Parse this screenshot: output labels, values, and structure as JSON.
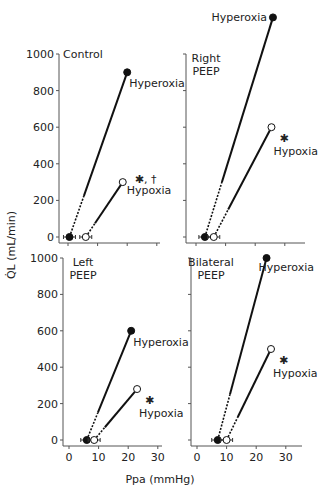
{
  "chart_data": {
    "type": "line",
    "ylabel": "Q̇L (mL/min)",
    "xlabel": "Ppa (mmHg)",
    "xlim": [
      0,
      35
    ],
    "ylim": [
      0,
      1000
    ],
    "xticks": [
      0,
      10,
      20,
      30
    ],
    "yticks": [
      0,
      200,
      400,
      600,
      800,
      1000
    ],
    "panels": [
      {
        "label": [
          "Control"
        ],
        "series": [
          {
            "name": "Hyperoxia",
            "marker": "filled",
            "points": [
              {
                "x": 0.5,
                "y": 0
              },
              {
                "x": 20,
                "y": 900
              }
            ],
            "annotation": ""
          },
          {
            "name": "Hypoxia",
            "marker": "open",
            "points": [
              {
                "x": 6,
                "y": 0
              },
              {
                "x": 18.5,
                "y": 300
              }
            ],
            "annotation": "✱, †"
          }
        ]
      },
      {
        "label": [
          "Right",
          "PEEP"
        ],
        "series": [
          {
            "name": "Hyperoxia",
            "marker": "filled",
            "points": [
              {
                "x": 3,
                "y": 0
              },
              {
                "x": 26,
                "y": 1200
              }
            ],
            "annotation": ""
          },
          {
            "name": "Hypoxia",
            "marker": "open",
            "points": [
              {
                "x": 6,
                "y": 0
              },
              {
                "x": 25.5,
                "y": 600
              }
            ],
            "annotation": "✱"
          }
        ]
      },
      {
        "label": [
          "Left",
          "PEEP"
        ],
        "series": [
          {
            "name": "Hyperoxia",
            "marker": "filled",
            "points": [
              {
                "x": 6,
                "y": 0
              },
              {
                "x": 21,
                "y": 600
              }
            ],
            "annotation": ""
          },
          {
            "name": "Hypoxia",
            "marker": "open",
            "points": [
              {
                "x": 8.5,
                "y": 0
              },
              {
                "x": 23,
                "y": 280
              }
            ],
            "annotation": "✱"
          }
        ]
      },
      {
        "label": [
          "Bilateral",
          "PEEP"
        ],
        "series": [
          {
            "name": "Hyperoxia",
            "marker": "filled",
            "points": [
              {
                "x": 7,
                "y": 0
              },
              {
                "x": 23.5,
                "y": 1000
              }
            ],
            "annotation": ""
          },
          {
            "name": "Hypoxia",
            "marker": "open",
            "points": [
              {
                "x": 10,
                "y": 0
              },
              {
                "x": 25,
                "y": 500
              }
            ],
            "annotation": "✱"
          }
        ]
      }
    ]
  }
}
